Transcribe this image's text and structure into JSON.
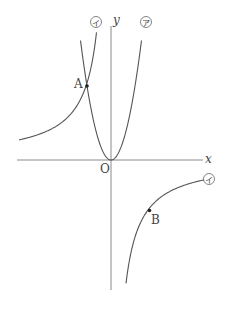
{
  "figure": {
    "type": "function-graph",
    "axes": {
      "x_label": "x",
      "y_label": "y",
      "origin_label": "O"
    },
    "curves": [
      {
        "id": "parabola",
        "label": "ア",
        "description": "y = ax^2 (a > 0), upward parabola through origin"
      },
      {
        "id": "hyperbola",
        "label": "イ",
        "description": "y = b/x (b < 0), branches in 2nd and 4th quadrants"
      }
    ],
    "points": [
      {
        "id": "A",
        "label": "A",
        "description": "intersection of ア and イ in 2nd quadrant"
      },
      {
        "id": "B",
        "label": "B",
        "description": "point on イ in 4th quadrant"
      }
    ]
  }
}
